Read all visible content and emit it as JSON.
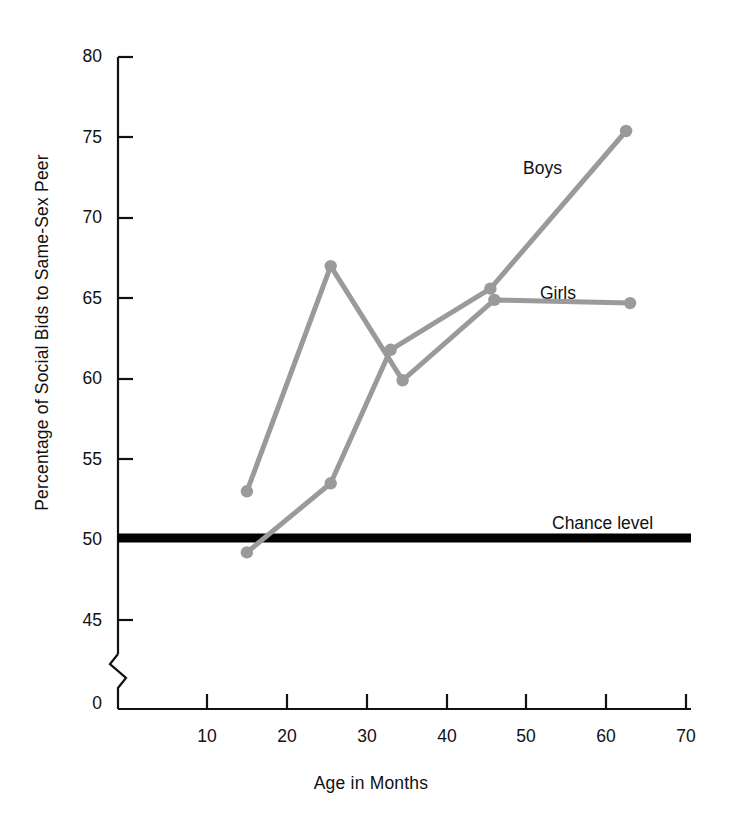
{
  "chart_data": {
    "type": "line",
    "title": "",
    "xlabel": "Age in Months",
    "ylabel": "Percentage of Social Bids to Same-Sex Peer",
    "xlim": [
      0,
      70
    ],
    "ylim": [
      43,
      80
    ],
    "grid": false,
    "legend_position": "inline-at-line-end",
    "xticks": [
      "10",
      "20",
      "30",
      "40",
      "50",
      "60",
      "70"
    ],
    "xtick_values": [
      10,
      20,
      30,
      40,
      50,
      60,
      70
    ],
    "yticks": [
      "45",
      "50",
      "55",
      "60",
      "65",
      "70",
      "75",
      "80"
    ],
    "ytick_values": [
      45,
      50,
      55,
      60,
      65,
      70,
      75,
      80
    ],
    "origin_tick": "0",
    "axis_break": true,
    "series": [
      {
        "name": "Girls",
        "color": "#9a9a9a",
        "x": [
          15,
          25.5,
          34.5,
          46,
          63
        ],
        "values": [
          53.0,
          67.0,
          59.9,
          64.9,
          64.7
        ]
      },
      {
        "name": "Boys",
        "color": "#9a9a9a",
        "x": [
          15,
          25.5,
          33,
          45.5,
          62.5
        ],
        "values": [
          49.2,
          53.5,
          61.8,
          65.6,
          75.4
        ]
      }
    ],
    "reference_lines": [
      {
        "label": "Chance level",
        "value": 50.1,
        "color": "#000000",
        "width_px": 9
      }
    ]
  },
  "annotations": {
    "boys_label": "Boys",
    "girls_label": "Girls",
    "chance_label": "Chance level"
  }
}
